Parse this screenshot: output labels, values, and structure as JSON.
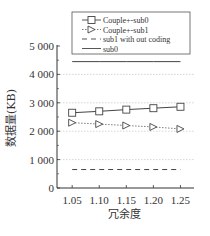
{
  "chart_data": {
    "type": "line",
    "title": "",
    "xlabel": "冗余度",
    "ylabel": "数据量(KB)",
    "x": [
      1.05,
      1.1,
      1.15,
      1.2,
      1.25
    ],
    "x_tick_labels": [
      "1.05",
      "1.10",
      "1.15",
      "1.20",
      "1.25"
    ],
    "y_tick_labels": [
      "0",
      "1 000",
      "2 000",
      "3 000",
      "4 000",
      "5 000"
    ],
    "y_ticks": [
      0,
      1000,
      2000,
      3000,
      4000,
      5000
    ],
    "xlim": [
      1.022,
      1.275
    ],
    "ylim": [
      0,
      5000
    ],
    "grid": true,
    "legend_position": "top",
    "series": [
      {
        "name": "Couple+-sub0",
        "marker": "square",
        "style": "solid",
        "values": [
          2650,
          2700,
          2760,
          2810,
          2860
        ]
      },
      {
        "name": "Couple+-sub1",
        "marker": "triangle-right",
        "style": "dotted",
        "values": [
          2300,
          2250,
          2200,
          2150,
          2080
        ]
      },
      {
        "name": "sub1 with out coding",
        "marker": "none",
        "style": "dashed",
        "values": [
          650,
          650,
          650,
          650,
          650
        ]
      },
      {
        "name": "sub0",
        "marker": "none",
        "style": "solid",
        "values": [
          4450,
          4450,
          4450,
          4450,
          4450
        ]
      }
    ],
    "colors": {
      "line": "#444444",
      "grid": "#cccccc",
      "axis": "#333333"
    }
  }
}
